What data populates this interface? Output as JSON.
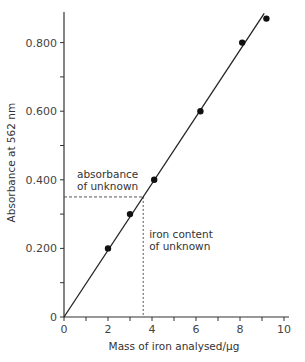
{
  "chart_data": {
    "type": "line",
    "title": "",
    "xlabel": "Mass of iron analysed/µg",
    "ylabel": "Absorbance at 562 nm",
    "xlim": [
      0,
      10
    ],
    "ylim": [
      0,
      0.9
    ],
    "x_ticks": [
      "0",
      "2",
      "4",
      "6",
      "8",
      "10"
    ],
    "y_ticks": [
      "0",
      "0.200",
      "0.400",
      "0.600",
      "0.800"
    ],
    "grid": false,
    "series": [
      {
        "name": "calibration points",
        "type": "scatter",
        "x": [
          2.0,
          3.0,
          4.1,
          6.2,
          8.1,
          9.2
        ],
        "y": [
          0.2,
          0.3,
          0.4,
          0.6,
          0.8,
          0.87
        ]
      },
      {
        "name": "best-fit line",
        "type": "line",
        "x": [
          0,
          9.1
        ],
        "y": [
          0,
          0.885
        ]
      }
    ],
    "annotations": [
      {
        "text": [
          "absorbance",
          "of unknown"
        ],
        "y": 0.35,
        "type": "horizontal-dashed"
      },
      {
        "text": [
          "iron content",
          "of unknown"
        ],
        "x": 3.6,
        "type": "vertical-dashed"
      }
    ]
  }
}
